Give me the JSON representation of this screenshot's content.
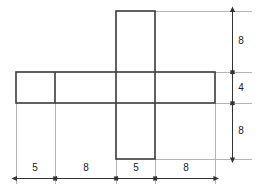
{
  "drawing": {
    "title": "Cross-shaped plan with dimensions",
    "shape_name": "cross-outline",
    "colors": {
      "outline": "#3a3a3a",
      "dimension_line": "#555555",
      "extension_line": "#b0b0b0",
      "text": "#222222",
      "background": "#ffffff"
    },
    "geometry": {
      "horizontal_bar": {
        "x": 16,
        "y": 72,
        "width": 199,
        "height": 31
      },
      "vertical_bar": {
        "x": 116,
        "y": 11,
        "width": 39,
        "height": 148
      },
      "inner_divider_x": 55
    }
  },
  "dimensions": {
    "horizontal": {
      "label": "bottom-dimension-row",
      "segments": [
        {
          "name": "seg-left-flange",
          "value": "5",
          "from": 16,
          "to": 55
        },
        {
          "name": "seg-left-web",
          "value": "8",
          "from": 55,
          "to": 116
        },
        {
          "name": "seg-center",
          "value": "5",
          "from": 116,
          "to": 155
        },
        {
          "name": "seg-right-web",
          "value": "8",
          "from": 155,
          "to": 215
        }
      ],
      "baseline_y": 178,
      "text_y": 168
    },
    "vertical": {
      "label": "right-dimension-column",
      "segments": [
        {
          "name": "seg-top",
          "value": "8",
          "from": 11,
          "to": 72
        },
        {
          "name": "seg-middle",
          "value": "4",
          "from": 72,
          "to": 103
        },
        {
          "name": "seg-bottom",
          "value": "8",
          "from": 103,
          "to": 159
        }
      ],
      "baseline_x": 232,
      "text_x": 241
    }
  },
  "labels": {
    "top_right_8": "8",
    "middle_right_4": "4",
    "bottom_right_8": "8",
    "bottom_5_left": "5",
    "bottom_8_left": "8",
    "bottom_5_center": "5",
    "bottom_8_right": "8"
  }
}
